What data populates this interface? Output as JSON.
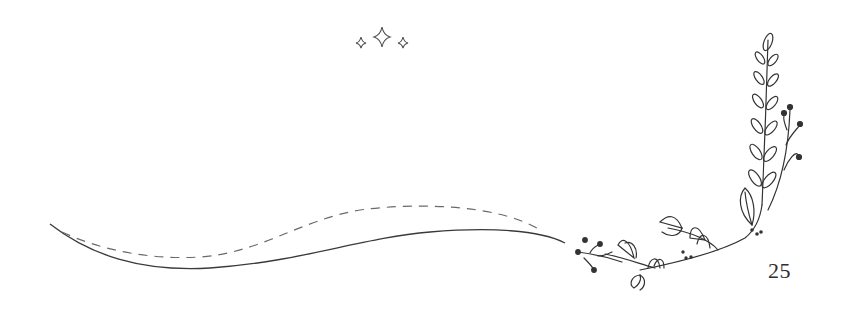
{
  "page": {
    "number": "25"
  },
  "decorations": {
    "sparkles": [
      "small-sparkle",
      "large-sparkle",
      "small-sparkle"
    ],
    "swash": [
      "solid-wave-line",
      "dashed-wave-line"
    ],
    "botanical": [
      "leafy-stem-vertical",
      "berry-sprig-vertical",
      "leafy-sprig-horizontal",
      "berry-sprig-horizontal",
      "dot-cluster"
    ]
  },
  "colors": {
    "ink": "#3a3a3a",
    "dashed": "#6a6a6a",
    "background": "#ffffff"
  }
}
